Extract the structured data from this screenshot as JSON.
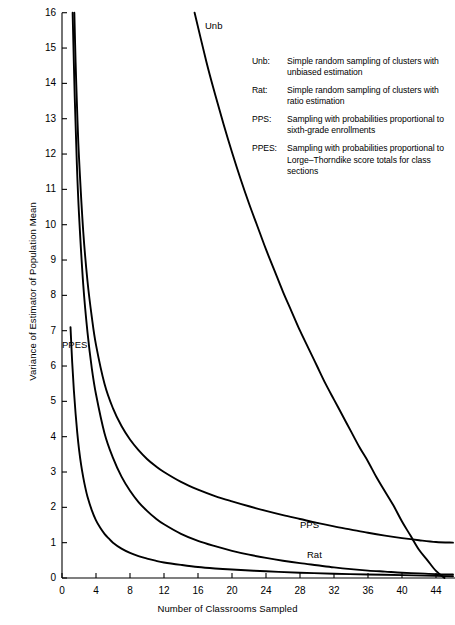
{
  "chart_data": {
    "type": "line",
    "title": "",
    "xlabel": "Number of Classrooms Sampled",
    "ylabel": "Variance of Estimator of Population Mean",
    "xlim": [
      0,
      46
    ],
    "ylim": [
      0,
      16
    ],
    "xticks": [
      0,
      4,
      8,
      12,
      16,
      20,
      24,
      28,
      32,
      36,
      40,
      44
    ],
    "yticks": [
      0,
      1,
      2,
      3,
      4,
      5,
      6,
      7,
      8,
      9,
      10,
      11,
      12,
      13,
      14,
      15,
      16
    ],
    "grid": false,
    "legend_position": "upper-right-inside",
    "series": [
      {
        "name": "Unb",
        "label": "Unb",
        "color": "#000000",
        "points": [
          [
            15.6,
            16.0
          ],
          [
            17,
            14.6
          ],
          [
            18,
            13.7
          ],
          [
            19,
            12.85
          ],
          [
            20,
            12.05
          ],
          [
            21,
            11.3
          ],
          [
            22,
            10.6
          ],
          [
            23,
            9.95
          ],
          [
            24,
            9.3
          ],
          [
            25,
            8.7
          ],
          [
            26,
            8.1
          ],
          [
            27,
            7.55
          ],
          [
            28,
            7.0
          ],
          [
            29,
            6.5
          ],
          [
            30,
            6.0
          ],
          [
            31,
            5.5
          ],
          [
            32,
            5.05
          ],
          [
            33,
            4.6
          ],
          [
            34,
            4.15
          ],
          [
            35,
            3.7
          ],
          [
            36,
            3.3
          ],
          [
            37,
            2.85
          ],
          [
            38,
            2.45
          ],
          [
            39,
            2.05
          ],
          [
            40,
            1.6
          ],
          [
            41,
            1.2
          ],
          [
            42,
            0.8
          ],
          [
            43,
            0.5
          ],
          [
            44,
            0.2
          ],
          [
            45,
            0.0
          ]
        ]
      },
      {
        "name": "Rat",
        "label": "Rat",
        "color": "#000000",
        "points": [
          [
            1.25,
            16.0
          ],
          [
            1.5,
            13.6
          ],
          [
            1.75,
            11.7
          ],
          [
            2,
            10.3
          ],
          [
            2.5,
            8.3
          ],
          [
            3,
            6.95
          ],
          [
            3.5,
            5.95
          ],
          [
            4,
            5.2
          ],
          [
            5,
            4.1
          ],
          [
            6,
            3.4
          ],
          [
            7,
            2.87
          ],
          [
            8,
            2.47
          ],
          [
            9,
            2.15
          ],
          [
            10,
            1.9
          ],
          [
            11,
            1.69
          ],
          [
            12,
            1.52
          ],
          [
            14,
            1.25
          ],
          [
            16,
            1.05
          ],
          [
            18,
            0.9
          ],
          [
            20,
            0.77
          ],
          [
            22,
            0.66
          ],
          [
            24,
            0.57
          ],
          [
            26,
            0.49
          ],
          [
            28,
            0.42
          ],
          [
            30,
            0.36
          ],
          [
            32,
            0.3
          ],
          [
            34,
            0.25
          ],
          [
            36,
            0.21
          ],
          [
            38,
            0.18
          ],
          [
            40,
            0.15
          ],
          [
            42,
            0.13
          ],
          [
            44,
            0.11
          ],
          [
            46,
            0.1
          ]
        ]
      },
      {
        "name": "PPS",
        "label": "PPS",
        "color": "#000000",
        "points": [
          [
            1.45,
            16.0
          ],
          [
            1.6,
            14.6
          ],
          [
            1.8,
            13.1
          ],
          [
            2,
            11.9
          ],
          [
            2.5,
            9.8
          ],
          [
            3,
            8.4
          ],
          [
            3.5,
            7.4
          ],
          [
            4,
            6.6
          ],
          [
            5,
            5.5
          ],
          [
            6,
            4.8
          ],
          [
            7,
            4.3
          ],
          [
            8,
            3.92
          ],
          [
            9,
            3.62
          ],
          [
            10,
            3.37
          ],
          [
            11,
            3.17
          ],
          [
            12,
            3.0
          ],
          [
            14,
            2.72
          ],
          [
            16,
            2.5
          ],
          [
            18,
            2.32
          ],
          [
            20,
            2.17
          ],
          [
            22,
            2.03
          ],
          [
            24,
            1.9
          ],
          [
            26,
            1.78
          ],
          [
            28,
            1.67
          ],
          [
            30,
            1.56
          ],
          [
            32,
            1.46
          ],
          [
            34,
            1.37
          ],
          [
            36,
            1.28
          ],
          [
            38,
            1.2
          ],
          [
            40,
            1.13
          ],
          [
            42,
            1.07
          ],
          [
            44,
            1.02
          ],
          [
            46,
            1.0
          ]
        ]
      },
      {
        "name": "PPES",
        "label": "PPES",
        "color": "#000000",
        "points": [
          [
            1,
            7.1
          ],
          [
            1.2,
            6.1
          ],
          [
            1.4,
            5.3
          ],
          [
            1.6,
            4.65
          ],
          [
            1.8,
            4.1
          ],
          [
            2,
            3.65
          ],
          [
            2.25,
            3.2
          ],
          [
            2.5,
            2.85
          ],
          [
            2.75,
            2.55
          ],
          [
            3,
            2.3
          ],
          [
            3.5,
            1.92
          ],
          [
            4,
            1.63
          ],
          [
            4.5,
            1.42
          ],
          [
            5,
            1.25
          ],
          [
            5.5,
            1.12
          ],
          [
            6,
            1.0
          ],
          [
            7,
            0.83
          ],
          [
            8,
            0.71
          ],
          [
            9,
            0.62
          ],
          [
            10,
            0.55
          ],
          [
            11,
            0.49
          ],
          [
            12,
            0.44
          ],
          [
            14,
            0.37
          ],
          [
            16,
            0.31
          ],
          [
            18,
            0.27
          ],
          [
            20,
            0.24
          ],
          [
            24,
            0.19
          ],
          [
            28,
            0.15
          ],
          [
            32,
            0.12
          ],
          [
            36,
            0.1
          ],
          [
            40,
            0.08
          ],
          [
            44,
            0.06
          ],
          [
            46,
            0.05
          ]
        ]
      }
    ]
  },
  "axes": {
    "ylabel": "Variance of Estimator of Population Mean",
    "xlabel": "Number of Classrooms Sampled",
    "ytick_labels": [
      "16",
      "15",
      "14",
      "13",
      "12",
      "11",
      "10",
      "9",
      "8",
      "7",
      "6",
      "5",
      "4",
      "3",
      "2",
      "1",
      "0"
    ],
    "xtick_labels": [
      "0",
      "4",
      "8",
      "12",
      "16",
      "20",
      "24",
      "28",
      "32",
      "36",
      "40",
      "44"
    ]
  },
  "curve_labels": {
    "unb": "Unb",
    "ppes": "PPES",
    "pps": "PPS",
    "rat": "Rat"
  },
  "legend": {
    "items": [
      {
        "key": "Unb:",
        "description": "Simple random sampling of clusters with unbiased estimation"
      },
      {
        "key": "Rat:",
        "description": "Simple random sampling of clusters with ratio estimation"
      },
      {
        "key": "PPS:",
        "description": "Sampling with probabilities proportional to sixth-grade enrollments"
      },
      {
        "key": "PPES:",
        "description": "Sampling with probabilities proportional to Lorge–Thorndike score totals for class sections"
      }
    ]
  },
  "colors": {
    "curve": "#000000",
    "axis": "#000000",
    "background": "#ffffff"
  }
}
